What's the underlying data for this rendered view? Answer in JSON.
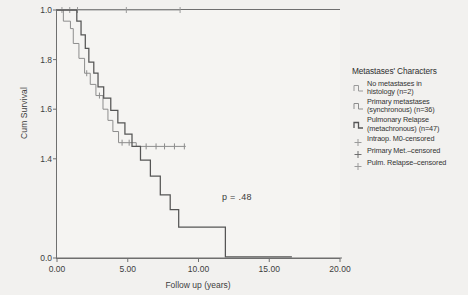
{
  "chart_data": {
    "type": "line",
    "title": "",
    "xlabel": "Follow up (years)",
    "ylabel": "Cum Survival",
    "xlim": [
      0.0,
      20.0
    ],
    "ylim": [
      0.0,
      1.0
    ],
    "xticks": [
      "0.00",
      "5.00",
      "10.00",
      "15.00",
      "20.00"
    ],
    "xtick_values": [
      0,
      5,
      10,
      15,
      20
    ],
    "yticks": [
      "0.0",
      "1.4",
      "1.6",
      "1.8",
      "1.0"
    ],
    "ytick_values": [
      0.0,
      0.4,
      0.6,
      0.8,
      1.0
    ],
    "grid": false,
    "legend_position": "right",
    "annotations": [
      {
        "text": "p = .48",
        "x": 13.0,
        "y": 0.28
      }
    ],
    "series": [
      {
        "name": "No metastases in histology (n=2)",
        "n": 2,
        "color": "#9a9a9a",
        "steps": [
          [
            0.0,
            1.0
          ],
          [
            8.7,
            1.0
          ]
        ],
        "censored": [
          [
            0.35,
            1.0
          ],
          [
            0.9,
            1.0
          ],
          [
            1.45,
            1.0
          ],
          [
            4.9,
            1.0
          ],
          [
            8.7,
            1.0
          ]
        ]
      },
      {
        "name": "Primary metastases (synchronous) (n=36)",
        "n": 36,
        "color": "#8d8d8d",
        "steps": [
          [
            0.0,
            1.0
          ],
          [
            0.45,
            1.0
          ],
          [
            0.45,
            0.955
          ],
          [
            0.95,
            0.955
          ],
          [
            0.95,
            0.925
          ],
          [
            1.15,
            0.925
          ],
          [
            1.15,
            0.865
          ],
          [
            1.55,
            0.865
          ],
          [
            1.55,
            0.805
          ],
          [
            1.95,
            0.805
          ],
          [
            1.95,
            0.745
          ],
          [
            2.35,
            0.745
          ],
          [
            2.35,
            0.7
          ],
          [
            2.75,
            0.7
          ],
          [
            2.75,
            0.655
          ],
          [
            3.25,
            0.655
          ],
          [
            3.25,
            0.6
          ],
          [
            3.6,
            0.6
          ],
          [
            3.6,
            0.555
          ],
          [
            3.95,
            0.555
          ],
          [
            3.95,
            0.51
          ],
          [
            4.35,
            0.51
          ],
          [
            4.35,
            0.465
          ],
          [
            5.6,
            0.465
          ],
          [
            5.6,
            0.45
          ],
          [
            9.1,
            0.45
          ]
        ],
        "censored": [
          [
            2.1,
            0.745
          ],
          [
            3.0,
            0.655
          ],
          [
            4.6,
            0.465
          ],
          [
            5.1,
            0.465
          ],
          [
            6.3,
            0.45
          ],
          [
            7.0,
            0.45
          ],
          [
            7.6,
            0.45
          ],
          [
            8.3,
            0.45
          ],
          [
            9.0,
            0.45
          ]
        ]
      },
      {
        "name": "Pulmonary Relapse (metachronous) (n=47)",
        "n": 47,
        "color": "#555555",
        "steps": [
          [
            0.0,
            1.0
          ],
          [
            1.4,
            1.0
          ],
          [
            1.4,
            0.955
          ],
          [
            1.7,
            0.955
          ],
          [
            1.7,
            0.9
          ],
          [
            2.0,
            0.9
          ],
          [
            2.0,
            0.845
          ],
          [
            2.25,
            0.845
          ],
          [
            2.25,
            0.79
          ],
          [
            2.6,
            0.79
          ],
          [
            2.6,
            0.745
          ],
          [
            2.9,
            0.745
          ],
          [
            2.9,
            0.69
          ],
          [
            3.3,
            0.69
          ],
          [
            3.3,
            0.645
          ],
          [
            3.8,
            0.645
          ],
          [
            3.8,
            0.595
          ],
          [
            4.3,
            0.595
          ],
          [
            4.3,
            0.545
          ],
          [
            4.8,
            0.545
          ],
          [
            4.8,
            0.5
          ],
          [
            5.3,
            0.5
          ],
          [
            5.3,
            0.45
          ],
          [
            5.9,
            0.45
          ],
          [
            5.9,
            0.395
          ],
          [
            6.6,
            0.395
          ],
          [
            6.6,
            0.33
          ],
          [
            7.3,
            0.33
          ],
          [
            7.3,
            0.255
          ],
          [
            8.0,
            0.255
          ],
          [
            8.0,
            0.195
          ],
          [
            8.6,
            0.195
          ],
          [
            8.6,
            0.125
          ],
          [
            11.9,
            0.125
          ],
          [
            11.9,
            0.005
          ],
          [
            16.6,
            0.005
          ]
        ],
        "censored": []
      }
    ]
  },
  "legend": {
    "title": "Metastases' Characters",
    "entries": [
      {
        "label_line1": "No metastases in",
        "label_line2": "histology (n=2)",
        "marker": "step-line",
        "color": "#9a9a9a"
      },
      {
        "label_line1": "Primary metastases",
        "label_line2": "(synchronous) (n=36)",
        "marker": "step-line",
        "color": "#8d8d8d"
      },
      {
        "label_line1": "Pulmonary Relapse",
        "label_line2": "(metachronous) (n=47)",
        "marker": "step-line",
        "color": "#555555"
      },
      {
        "label_line1": "Intraop. M0-censored",
        "label_line2": "",
        "marker": "plus",
        "color": "#9a9a9a"
      },
      {
        "label_line1": "Primary Met.–censored",
        "label_line2": "",
        "marker": "plus",
        "color": "#6f6f6f"
      },
      {
        "label_line1": "Pulm. Relapse–censored",
        "label_line2": "",
        "marker": "plus",
        "color": "#9a9a9a"
      }
    ]
  }
}
